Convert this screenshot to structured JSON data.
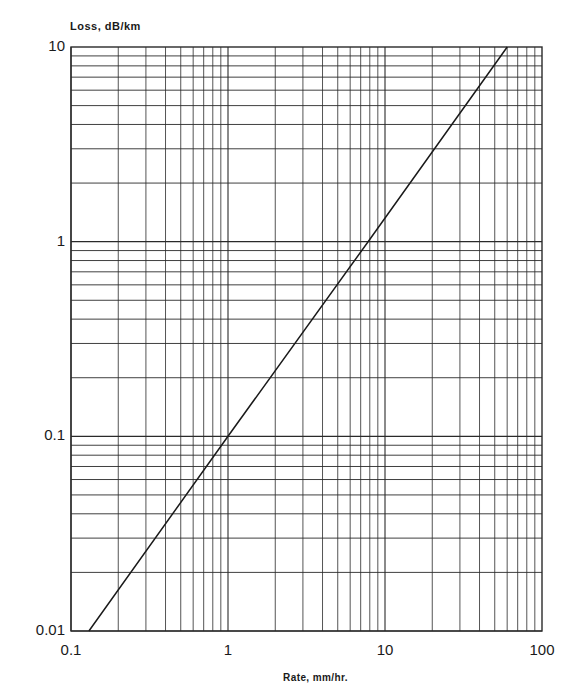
{
  "chart_data": {
    "type": "line",
    "title": "",
    "xlabel": "Rate, mm/hr.",
    "ylabel": "Loss, dB/km",
    "xscale": "log",
    "yscale": "log",
    "xlim": [
      0.1,
      100
    ],
    "ylim": [
      0.01,
      10
    ],
    "grid": true,
    "x_tick_labels": [
      "0.1",
      "1",
      "10",
      "100"
    ],
    "y_tick_labels": [
      "0.01",
      "0.1",
      "1",
      "10"
    ],
    "series": [
      {
        "name": "Rain attenuation",
        "x": [
          0.13,
          1,
          7.8,
          60
        ],
        "y": [
          0.01,
          0.1,
          1,
          10
        ]
      }
    ]
  },
  "colors": {
    "grid": "#2a2a2a",
    "line": "#1a1a1a",
    "background": "#ffffff"
  },
  "layout": {
    "plot_left": 71,
    "plot_top": 47,
    "plot_right": 542,
    "plot_bottom": 631
  }
}
